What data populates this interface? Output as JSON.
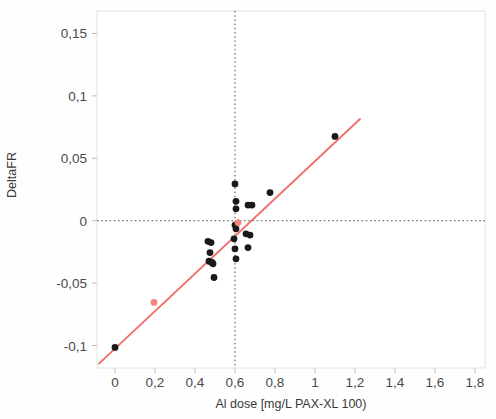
{
  "chart_data": {
    "type": "scatter",
    "title": "",
    "xlabel": "Al dose [mg/L PAX-XL 100)",
    "ylabel": "DeltaFR",
    "xlim": [
      -0.09,
      1.85
    ],
    "ylim": [
      -0.118,
      0.168
    ],
    "xticks": [
      "0",
      "0,2",
      "0,4",
      "0,6",
      "0,8",
      "1",
      "1,2",
      "1,4",
      "1,6",
      "1,8"
    ],
    "xtick_values": [
      0,
      0.2,
      0.4,
      0.6,
      0.8,
      1.0,
      1.2,
      1.4,
      1.6,
      1.8
    ],
    "yticks": [
      "0,15",
      "0,1",
      "0,05",
      "0",
      "-0,05",
      "-0,1"
    ],
    "ytick_values": [
      0.15,
      0.1,
      0.05,
      0,
      -0.05,
      -0.1
    ],
    "grid": false,
    "legend": null,
    "reference_lines": [
      {
        "name": "zero-horizontal",
        "orientation": "horizontal",
        "value": 0,
        "style": "dotted",
        "color": "#555555"
      },
      {
        "name": "dose-vertical",
        "orientation": "vertical",
        "value": 0.6,
        "style": "dotted",
        "color": "#555555"
      }
    ],
    "fit_line": {
      "name": "regression-line",
      "color": "#f1706b",
      "x_start": -0.08,
      "y_start": -0.1145,
      "x_end": 1.225,
      "y_end": 0.0815
    },
    "series": [
      {
        "name": "measurements",
        "color": "#1a1a1a",
        "marker": "circle",
        "points": [
          {
            "x": 0.0,
            "y": -0.1015
          },
          {
            "x": 0.465,
            "y": -0.0165
          },
          {
            "x": 0.48,
            "y": -0.0175
          },
          {
            "x": 0.475,
            "y": -0.0255
          },
          {
            "x": 0.47,
            "y": -0.0325
          },
          {
            "x": 0.485,
            "y": -0.0335
          },
          {
            "x": 0.49,
            "y": -0.0345
          },
          {
            "x": 0.495,
            "y": -0.0455
          },
          {
            "x": 0.6,
            "y": 0.0295
          },
          {
            "x": 0.605,
            "y": 0.0155
          },
          {
            "x": 0.605,
            "y": 0.0095
          },
          {
            "x": 0.6,
            "y": -0.0035
          },
          {
            "x": 0.605,
            "y": -0.0065
          },
          {
            "x": 0.595,
            "y": -0.0145
          },
          {
            "x": 0.6,
            "y": -0.0225
          },
          {
            "x": 0.605,
            "y": -0.0305
          },
          {
            "x": 0.665,
            "y": 0.0125
          },
          {
            "x": 0.655,
            "y": -0.0105
          },
          {
            "x": 0.675,
            "y": -0.0115
          },
          {
            "x": 0.665,
            "y": -0.0215
          },
          {
            "x": 0.685,
            "y": 0.0125
          },
          {
            "x": 0.775,
            "y": 0.0225
          },
          {
            "x": 1.1,
            "y": 0.0675
          }
        ]
      },
      {
        "name": "highlighted-measurements",
        "color": "#f4857f",
        "marker": "circle",
        "points": [
          {
            "x": 0.195,
            "y": -0.0655
          },
          {
            "x": 0.615,
            "y": -0.0015
          }
        ]
      }
    ]
  }
}
